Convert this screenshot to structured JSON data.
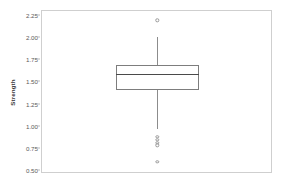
{
  "chart_data": {
    "type": "box",
    "title": "",
    "xlabel": "",
    "ylabel": "Strength",
    "ylim": [
      0.42,
      2.32
    ],
    "grid": false,
    "legend": null,
    "yticks": [
      0.5,
      0.75,
      1.0,
      1.25,
      1.5,
      1.75,
      2.0,
      2.25
    ],
    "ytick_labels": [
      "0.50",
      "0.75",
      "1.00",
      "1.25",
      "1.50",
      "1.75",
      "2.00",
      "2.25"
    ],
    "categories": [
      "Strength"
    ],
    "boxes": [
      {
        "name": "Strength",
        "whisker_low": 0.93,
        "q1": 1.39,
        "median": 1.575,
        "q3": 1.68,
        "whisker_high": 2.0,
        "outliers": [
          2.2,
          0.845,
          0.805,
          0.775,
          0.745,
          0.55
        ]
      }
    ]
  },
  "figure": {
    "background_color": "#ffffff",
    "frame_color": "#cfcfcf",
    "tick_color": "#b9b9b9",
    "box_edge_color": "#7d7d7d",
    "median_color": "#4a4a4a",
    "whisker_color": "#8c8c8c",
    "outlier_color": "#9a9a9a"
  },
  "axis": {
    "title": "Strength",
    "tick_0": "2.25",
    "tick_1": "2.00",
    "tick_2": "1.75",
    "tick_3": "1.50",
    "tick_4": "1.25",
    "tick_5": "1.00",
    "tick_6": "0.75",
    "tick_7": "0.50"
  }
}
